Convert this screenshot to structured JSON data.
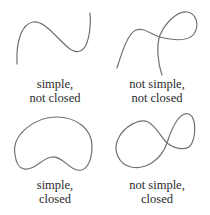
{
  "figure": {
    "stroke_color": "#707070",
    "panels": [
      {
        "id": "simple-not-closed",
        "line1": "simple,",
        "line2": "not closed",
        "curve": "open simple curve"
      },
      {
        "id": "not-simple-not-closed",
        "line1": "not simple,",
        "line2": "not closed",
        "curve": "open self-intersecting curve"
      },
      {
        "id": "simple-closed",
        "line1": "simple,",
        "line2": "closed",
        "curve": "closed simple kidney-shaped curve"
      },
      {
        "id": "not-simple-closed",
        "line1": "not simple,",
        "line2": "closed",
        "curve": "closed figure-eight curve"
      }
    ]
  }
}
